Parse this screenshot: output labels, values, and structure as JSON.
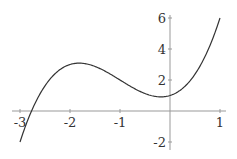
{
  "chart_data": {
    "type": "line",
    "title": "",
    "xlabel": "",
    "ylabel": "",
    "function": "x^3 + 3x^2 + x + 1",
    "xlim": [
      -3.0,
      1.0
    ],
    "ylim": [
      -2.2,
      6.0
    ],
    "grid": false,
    "x_ticks": [
      "-3",
      "-2",
      "-1",
      "1"
    ],
    "y_ticks": [
      "6",
      "4",
      "2",
      "-2"
    ],
    "series": [
      {
        "name": "f(x)",
        "x": [
          -3.0,
          -2.75,
          -2.5,
          -2.25,
          -2.0,
          -1.82,
          -1.5,
          -1.25,
          -1.0,
          -0.75,
          -0.5,
          -0.18,
          0.0,
          0.25,
          0.5,
          0.75,
          1.0
        ],
        "values": [
          -2.0,
          0.05,
          1.38,
          2.17,
          3.0,
          3.09,
          2.88,
          2.47,
          2.0,
          1.51,
          1.13,
          0.91,
          1.0,
          1.45,
          2.38,
          3.86,
          6.0
        ]
      }
    ],
    "colors": {
      "line": "#333333",
      "axis": "#999999"
    }
  }
}
